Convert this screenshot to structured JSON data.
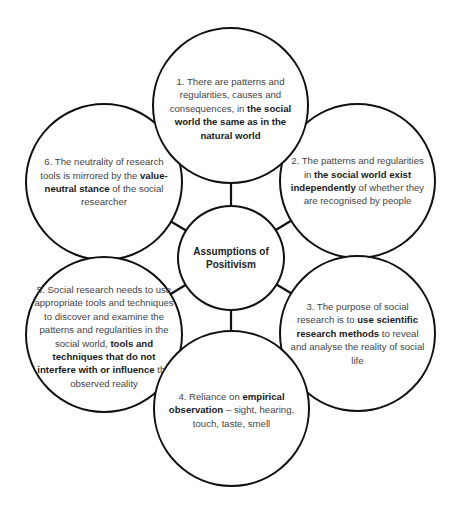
{
  "diagram": {
    "type": "hub-and-spoke",
    "center": {
      "label_line1": "Assumptions of",
      "label_line2": "Positivism"
    },
    "nodes": [
      {
        "id": 1,
        "segments": [
          {
            "text": "1. There are patterns and regularities, causes and consequences, in ",
            "bold": false
          },
          {
            "text": "the social world the same as in the natural world",
            "bold": true
          }
        ]
      },
      {
        "id": 2,
        "segments": [
          {
            "text": "2. The patterns and regularities in ",
            "bold": false
          },
          {
            "text": "the social world exist independently",
            "bold": true
          },
          {
            "text": " of whether they are recognised by people",
            "bold": false
          }
        ]
      },
      {
        "id": 3,
        "segments": [
          {
            "text": "3. The purpose of social research is to ",
            "bold": false
          },
          {
            "text": "use scientific research methods",
            "bold": true
          },
          {
            "text": " to reveal and analyse the reality of social life",
            "bold": false
          }
        ]
      },
      {
        "id": 4,
        "segments": [
          {
            "text": "4. Reliance on ",
            "bold": false
          },
          {
            "text": "empirical observation",
            "bold": true
          },
          {
            "text": " – sight, hearing, touch, taste, smell",
            "bold": false
          }
        ]
      },
      {
        "id": 5,
        "segments": [
          {
            "text": "5. Social research needs to use appropriate tools and techniques to discover and examine the patterns and regularities in the social world, ",
            "bold": false
          },
          {
            "text": "tools and techniques that do not interfere with or influence",
            "bold": true
          },
          {
            "text": " the observed reality",
            "bold": false
          }
        ]
      },
      {
        "id": 6,
        "segments": [
          {
            "text": "6. The neutrality of research tools is mirrored by the ",
            "bold": false
          },
          {
            "text": "value-neutral stance",
            "bold": true
          },
          {
            "text": " of the social researcher",
            "bold": false
          }
        ]
      }
    ],
    "colors": {
      "stroke": "#111111",
      "fill": "#ffffff",
      "text": "#444444",
      "bold_text": "#1a1a1a"
    }
  }
}
